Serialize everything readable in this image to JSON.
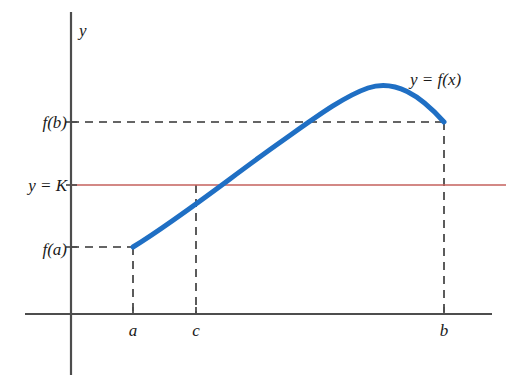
{
  "figure": {
    "background_color": "#ffffff"
  },
  "axes": {
    "y_axis_label": "y",
    "axis_color": "#4d4d4d",
    "x_axis": {
      "x1": 25,
      "y1": 314,
      "x2": 492,
      "y2": 314
    },
    "y_axis": {
      "x1": 71,
      "y1": 12,
      "x2": 71,
      "y2": 375
    }
  },
  "chart_data": {
    "type": "line",
    "title": "",
    "xlabel": "",
    "ylabel": "y",
    "grid": false,
    "legend": "none",
    "annotations": [
      {
        "name": "curve-label",
        "text": "y = f(x)",
        "x": 410,
        "y": 85
      },
      {
        "name": "level-label",
        "text": "y = K",
        "x": 66,
        "y": 191
      },
      {
        "name": "fb-label",
        "text": "f(b)",
        "x": 66,
        "y": 128
      },
      {
        "name": "fa-label",
        "text": "f(a)",
        "x": 66,
        "y": 255
      }
    ],
    "x_tick_labels": [
      "a",
      "c",
      "b"
    ],
    "x_tick_positions": [
      133,
      196,
      444
    ],
    "y_tick_labels": [
      "f(b)",
      "y = K",
      "f(a)"
    ],
    "y_tick_positions": [
      122,
      185,
      247
    ],
    "series": [
      {
        "name": "y = f(x)",
        "type": "curve",
        "color": "#1f6fc4",
        "width": 5,
        "path": "M 133 247 C 180 218, 230 178, 275 146 C 312 120, 342 97, 368 88 C 395 79, 420 95, 444 122",
        "points": [
          {
            "label": "(a, f(a))",
            "x": 133,
            "y": 247
          },
          {
            "label": "(c, K)",
            "x": 196,
            "y": 185
          },
          {
            "label": "peak",
            "x": 368,
            "y": 88
          },
          {
            "label": "(b, f(b))",
            "x": 444,
            "y": 122
          }
        ]
      },
      {
        "name": "y = K",
        "type": "horizontal-line",
        "color": "#c4605c",
        "width": 1.4,
        "y": 185,
        "x_start": 71,
        "x_end": 506
      }
    ],
    "guide_lines": [
      {
        "name": "fb-horizontal-dashed",
        "x1": 71,
        "y1": 122,
        "x2": 444,
        "y2": 122
      },
      {
        "name": "fa-horizontal-dashed",
        "x1": 71,
        "y1": 247,
        "x2": 133,
        "y2": 247
      },
      {
        "name": "a-vertical-dashed",
        "x1": 133,
        "y1": 247,
        "x2": 133,
        "y2": 314
      },
      {
        "name": "c-vertical-dashed",
        "x1": 196,
        "y1": 185,
        "x2": 196,
        "y2": 314
      },
      {
        "name": "b-vertical-dashed",
        "x1": 444,
        "y1": 122,
        "x2": 444,
        "y2": 314
      }
    ],
    "guide_color": "#333333"
  },
  "ticks": {
    "a": {
      "label": "a",
      "x": 133,
      "label_y": 336
    },
    "c": {
      "label": "c",
      "x": 196,
      "label_y": 336
    },
    "b": {
      "label": "b",
      "x": 444,
      "label_y": 336
    }
  }
}
